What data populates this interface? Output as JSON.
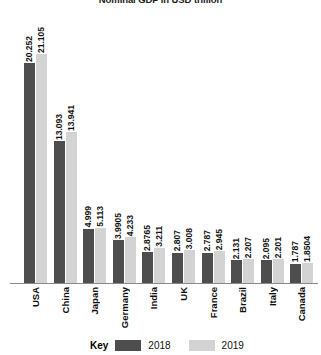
{
  "chart_data": {
    "type": "bar",
    "title": "Nominal GDP in USD trillion",
    "xlabel": "",
    "ylabel": "",
    "ylim": [
      0,
      21.105
    ],
    "grid": false,
    "legend_position": "bottom",
    "legend_title": "Key",
    "categories": [
      "USA",
      "China",
      "Japan",
      "Germany",
      "India",
      "UK",
      "France",
      "Brazil",
      "Italy",
      "Canada"
    ],
    "series": [
      {
        "name": "2018",
        "color": "#4e4e4e",
        "values": [
          20.252,
          13.093,
          4.999,
          3.9905,
          2.8765,
          2.807,
          2.787,
          2.131,
          2.095,
          1.787
        ],
        "labels": [
          "20.252",
          "13.093",
          "4.999",
          "3.9905",
          "2.8765",
          "2.807",
          "2.787",
          "2.131",
          "2.095",
          "1.787"
        ]
      },
      {
        "name": "2019",
        "color": "#d3d3d3",
        "values": [
          21.105,
          13.941,
          5.113,
          4.233,
          3.211,
          3.008,
          2.945,
          2.207,
          2.201,
          1.8504
        ],
        "labels": [
          "21.105",
          "13.941",
          "5.113",
          "4.233",
          "3.211",
          "3.008",
          "2.945",
          "2.207",
          "2.201",
          "1.8504"
        ]
      }
    ]
  },
  "legend": {
    "key_label": "Key",
    "entries": [
      {
        "label": "2018",
        "color": "#4e4e4e"
      },
      {
        "label": "2019",
        "color": "#d3d3d3"
      }
    ]
  }
}
